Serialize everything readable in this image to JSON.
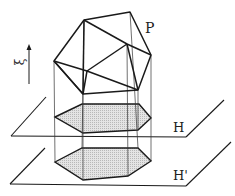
{
  "diagram": {
    "labels": {
      "polytope": "P",
      "direction": "ξ",
      "plane_upper": "H",
      "plane_lower": "H'"
    },
    "colors": {
      "stroke": "#1a1a1a",
      "fill_shadow": "#d6d6d6",
      "background": "#ffffff"
    }
  }
}
